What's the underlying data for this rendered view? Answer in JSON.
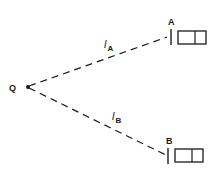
{
  "diagram": {
    "point": {
      "label": "Q"
    },
    "receivers": [
      {
        "label": "A",
        "path_label_main": "l",
        "path_label_sub": "A"
      },
      {
        "label": "B",
        "path_label_main": "l",
        "path_label_sub": "B"
      }
    ],
    "colors": {
      "stroke": "#1a1a1a",
      "background": "#ffffff"
    }
  }
}
